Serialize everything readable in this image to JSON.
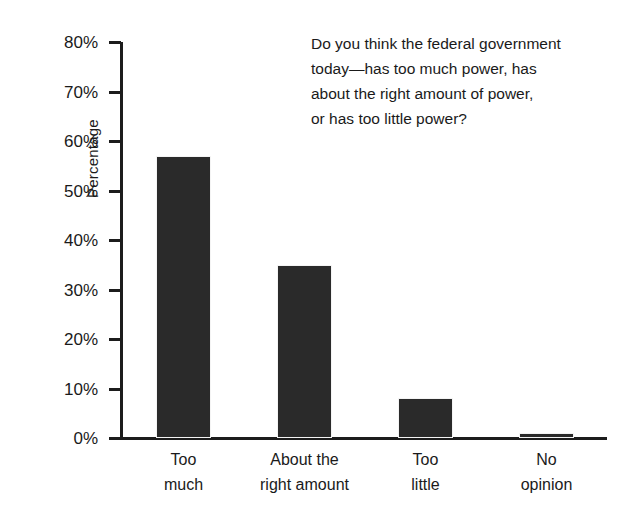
{
  "chart_data": {
    "type": "bar",
    "title": "",
    "subtitle": "",
    "xlabel": "",
    "ylabel": "Percentage",
    "categories": [
      "Too much",
      "About the right amount",
      "Too little",
      "No opinion"
    ],
    "category_lines": [
      [
        "Too",
        "much"
      ],
      [
        "About the",
        "right amount"
      ],
      [
        "Too",
        "little"
      ],
      [
        "No",
        "opinion"
      ]
    ],
    "values": [
      57,
      35,
      8,
      1
    ],
    "value_labels": [
      "57%",
      "35%",
      "8%",
      "1%"
    ],
    "ylim": [
      0,
      80
    ],
    "ytick_values": [
      0,
      10,
      20,
      30,
      40,
      50,
      60,
      70,
      80
    ],
    "ytick_labels": [
      "0%",
      "10%",
      "20%",
      "30%",
      "40%",
      "50%",
      "60%",
      "70%",
      "80%"
    ],
    "grid": false,
    "legend": false,
    "legend_position": "none",
    "bar_color": "#2a2a2a",
    "axis_color": "#1c1c1c",
    "background_color": "#ffffff",
    "annotations": [
      {
        "name": "survey-question",
        "text": "Do you think the federal government today—has too much power, has about the right amount of power, or has too little power?",
        "lines": [
          "Do you think the federal government",
          "today—has too much power, has",
          "about the right amount of power,",
          "or has too little power?"
        ],
        "position": "upper-right"
      }
    ]
  }
}
